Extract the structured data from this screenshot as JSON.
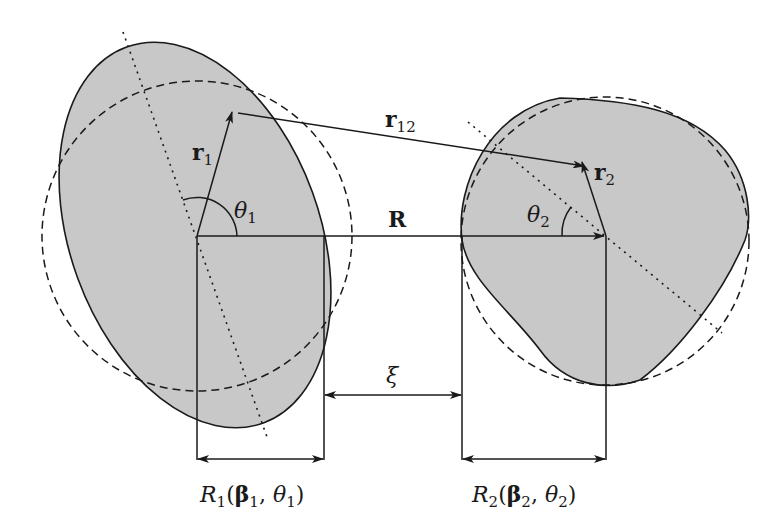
{
  "diagram": {
    "type": "geometry-schematic",
    "colors": {
      "body_fill": "#c8c8c8",
      "stroke": "#1a1a1a",
      "background": "#ffffff"
    },
    "labels": {
      "r1": {
        "base": "r",
        "sub": "1"
      },
      "r12": {
        "base": "r",
        "sub": "12"
      },
      "r2": {
        "base": "r",
        "sub": "2"
      },
      "theta1": {
        "base": "θ",
        "sub": "1"
      },
      "theta2": {
        "base": "θ",
        "sub": "2"
      },
      "R": "R",
      "xi": "ξ",
      "R1": {
        "base": "R",
        "sub": "1",
        "args_open": "(",
        "beta": "β",
        "beta_sub": "1",
        "sep": ", ",
        "theta": "θ",
        "theta_sub": "1",
        "args_close": ")"
      },
      "R2": {
        "base": "R",
        "sub": "2",
        "args_open": "(",
        "beta": "β",
        "beta_sub": "2",
        "sep": ", ",
        "theta": "θ",
        "theta_sub": "2",
        "args_close": ")"
      }
    },
    "bodies": [
      {
        "name": "particle-1",
        "shape": "ellipse",
        "dashed_circle": true,
        "dotted_axis": true
      },
      {
        "name": "particle-2",
        "shape": "rounded-triangle",
        "dashed_circle": true,
        "dotted_axis": true
      }
    ]
  }
}
